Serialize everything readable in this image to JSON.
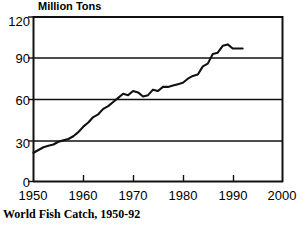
{
  "chart_data": {
    "type": "line",
    "title": "Million Tons",
    "caption": "World Fish Catch, 1950-92",
    "xlabel": "",
    "ylabel": "Million Tons",
    "xlim": [
      1950,
      2000
    ],
    "ylim": [
      0,
      120
    ],
    "grid": true,
    "gridlines_y": [
      30,
      60,
      90
    ],
    "legend": "none",
    "xticks": [
      1950,
      1960,
      1970,
      1980,
      1990,
      2000
    ],
    "xtick_labels": [
      "1950",
      "1960",
      "1970",
      "1980",
      "1990",
      "2000"
    ],
    "yticks": [
      0,
      30,
      60,
      90,
      120
    ],
    "ytick_labels": [
      "0",
      "30",
      "60",
      "90",
      "120"
    ],
    "series_name": "World Fish Catch",
    "line_color": "#111111",
    "x": [
      1950,
      1951,
      1952,
      1953,
      1954,
      1955,
      1956,
      1957,
      1958,
      1959,
      1960,
      1961,
      1962,
      1963,
      1964,
      1965,
      1966,
      1967,
      1968,
      1969,
      1970,
      1971,
      1972,
      1973,
      1974,
      1975,
      1976,
      1977,
      1978,
      1979,
      1980,
      1981,
      1982,
      1983,
      1984,
      1985,
      1986,
      1987,
      1988,
      1989,
      1990,
      1991,
      1992
    ],
    "values": [
      21,
      23,
      25,
      26,
      27,
      29,
      30,
      31,
      33,
      36,
      40,
      43,
      47,
      49,
      53,
      55,
      58,
      61,
      64,
      63,
      66,
      65,
      62,
      63,
      67,
      66,
      69,
      69,
      70,
      71,
      72,
      75,
      77,
      78,
      84,
      86,
      93,
      94,
      99,
      100,
      97,
      97,
      97
    ],
    "units": "million tons",
    "data_end_year": 1992
  },
  "axes": {
    "y_title": "Million Tons",
    "y_labels": [
      "120",
      "90",
      "60",
      "30",
      "0"
    ],
    "x_labels": [
      "1950",
      "1960",
      "1970",
      "1980",
      "1990",
      "2000"
    ]
  },
  "figure": {
    "caption": "World Fish Catch, 1950-92"
  }
}
